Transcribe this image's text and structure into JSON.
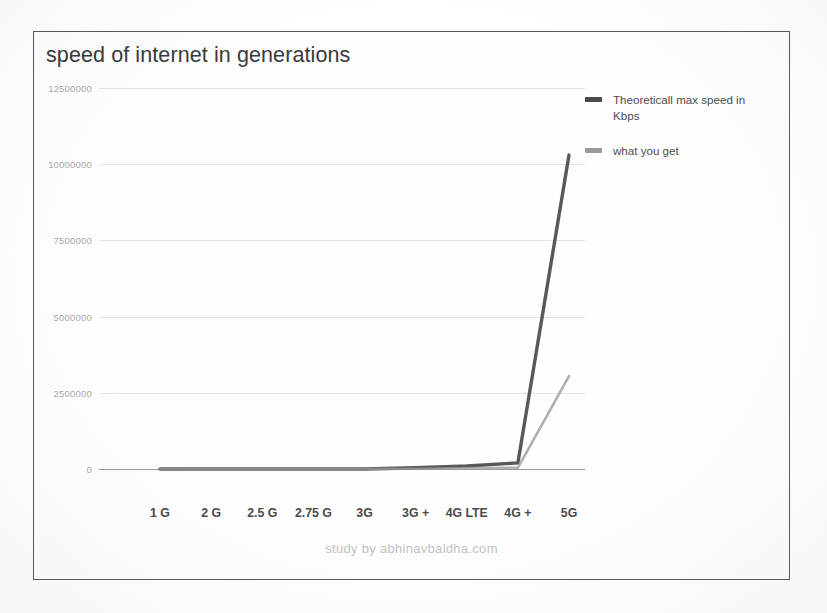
{
  "chart_data": {
    "type": "line",
    "title": "speed of internet in generations",
    "xlabel": "",
    "ylabel": "",
    "categories": [
      "1 G",
      "2 G",
      "2.5 G",
      "2.75 G",
      "3G",
      "3G +",
      "4G LTE",
      "4G +",
      "5G"
    ],
    "yticks": [
      0,
      2500000,
      5000000,
      7500000,
      10000000,
      12500000
    ],
    "ytick_labels": [
      "0",
      "2500000",
      "5000000",
      "7500000",
      "10000000",
      "12500000"
    ],
    "ylim": [
      0,
      12500000
    ],
    "grid": true,
    "legend_position": "right",
    "series": [
      {
        "name": "Theoreticall max speed in Kbps",
        "color": "#4a4a4a",
        "values": [
          2.4,
          64,
          144,
          384,
          2000,
          42000,
          100000,
          200000,
          10300000
        ]
      },
      {
        "name": "what you get",
        "color": "#9a9a9a",
        "values": [
          1,
          20,
          50,
          120,
          500,
          8000,
          20000,
          40000,
          3050000
        ]
      }
    ]
  },
  "legend": {
    "items": [
      {
        "label": "Theoreticall max speed in Kbps",
        "color": "#4a4a4a"
      },
      {
        "label": "what you get",
        "color": "#9a9a9a"
      }
    ]
  },
  "footer": {
    "credit": "study by abhinavbaldha.com"
  }
}
